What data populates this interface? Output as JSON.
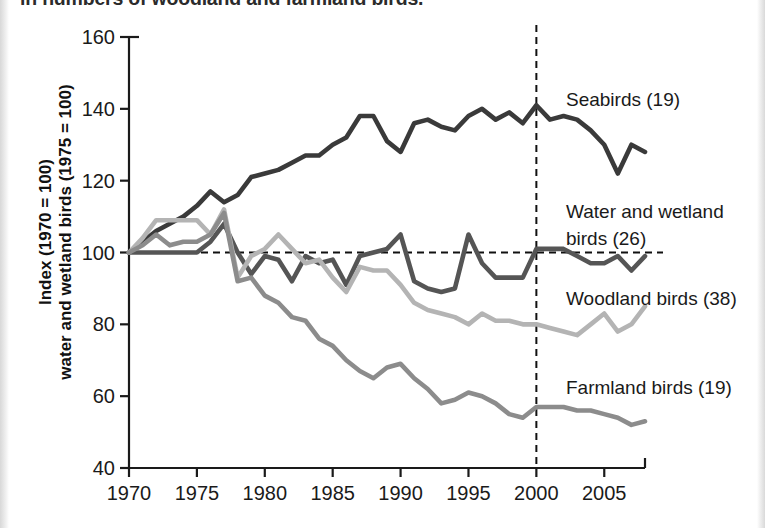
{
  "page": {
    "caption_partial": "in numbers of woodland and farmland birds."
  },
  "axis": {
    "ylabel_line1": "Index (1970 = 100)",
    "ylabel_line2": "water and wetland birds (1975 = 100)",
    "y_ticks": [
      "40",
      "60",
      "80",
      "100",
      "120",
      "140",
      "160"
    ],
    "x_ticks": [
      "1970",
      "1975",
      "1980",
      "1985",
      "1990",
      "1995",
      "2000",
      "2005"
    ]
  },
  "annotations": {
    "seabirds_label": "Seabirds (19)",
    "water_label_line1": "Water and wetland",
    "water_label_line2": "birds (26)",
    "woodland_label": "Woodland birds (38)",
    "farmland_label": "Farmland birds (19)",
    "reference_line_y": "100",
    "reference_line_x": "2000"
  },
  "colors": {
    "seabirds": "#3a3a3a",
    "water_wetland": "#555555",
    "woodland": "#b4b4b4",
    "farmland": "#8c8c8c",
    "axis": "#1a1a1a",
    "background": "#ffffff"
  },
  "chart_data": {
    "type": "line",
    "title": "",
    "xlabel": "",
    "ylabel": "Index (1970 = 100) water and wetland birds (1975 = 100)",
    "xlim": [
      1970,
      2008
    ],
    "ylim": [
      40,
      160
    ],
    "grid": false,
    "legend_position": "inline-right",
    "reference_lines": [
      {
        "axis": "y",
        "value": 100,
        "style": "dashed"
      },
      {
        "axis": "x",
        "value": 2000,
        "style": "dashed"
      }
    ],
    "x": [
      1970,
      1971,
      1972,
      1973,
      1974,
      1975,
      1976,
      1977,
      1978,
      1979,
      1980,
      1981,
      1982,
      1983,
      1984,
      1985,
      1986,
      1987,
      1988,
      1989,
      1990,
      1991,
      1992,
      1993,
      1994,
      1995,
      1996,
      1997,
      1998,
      1999,
      2000,
      2001,
      2002,
      2003,
      2004,
      2005,
      2006,
      2007,
      2008
    ],
    "series": [
      {
        "name": "Seabirds (19)",
        "color": "#3a3a3a",
        "values": [
          100,
          103,
          106,
          108,
          110,
          113,
          117,
          114,
          116,
          121,
          122,
          123,
          125,
          127,
          127,
          130,
          132,
          138,
          138,
          131,
          128,
          136,
          137,
          135,
          134,
          138,
          140,
          137,
          139,
          136,
          141,
          137,
          138,
          137,
          134,
          130,
          122,
          130,
          128
        ]
      },
      {
        "name": "Water and wetland birds (26)",
        "color": "#555555",
        "values": [
          100,
          100,
          100,
          100,
          100,
          100,
          103,
          108,
          100,
          94,
          99,
          98,
          92,
          99,
          97,
          98,
          91,
          99,
          100,
          101,
          105,
          92,
          90,
          89,
          90,
          105,
          97,
          93,
          93,
          93,
          101,
          101,
          101,
          99,
          97,
          97,
          99,
          95,
          99
        ]
      },
      {
        "name": "Woodland birds (38)",
        "color": "#b4b4b4",
        "values": [
          100,
          104,
          109,
          109,
          109,
          109,
          105,
          112,
          93,
          99,
          101,
          105,
          101,
          97,
          98,
          93,
          89,
          96,
          95,
          95,
          91,
          86,
          84,
          83,
          82,
          80,
          83,
          81,
          81,
          80,
          80,
          79,
          78,
          77,
          80,
          83,
          78,
          80,
          85
        ]
      },
      {
        "name": "Farmland birds (19)",
        "color": "#8c8c8c",
        "values": [
          100,
          102,
          105,
          102,
          103,
          103,
          105,
          111,
          92,
          93,
          88,
          86,
          82,
          81,
          76,
          74,
          70,
          67,
          65,
          68,
          69,
          65,
          62,
          58,
          59,
          61,
          60,
          58,
          55,
          54,
          57,
          57,
          57,
          56,
          56,
          55,
          54,
          52,
          53
        ]
      }
    ]
  }
}
